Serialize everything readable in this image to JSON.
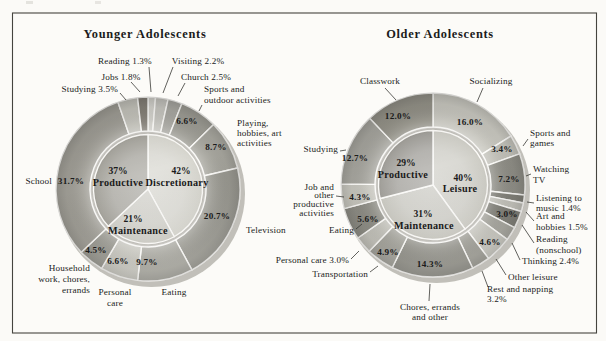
{
  "chart_data": [
    {
      "type": "pie",
      "variant": "nested-donut",
      "title": "Younger Adolescents",
      "inner": [
        {
          "name": "Discretionary",
          "pct_label": "42%",
          "value": 42,
          "shade": "#d4d3cb"
        },
        {
          "name": "Maintenance",
          "pct_label": "21%",
          "value": 21,
          "shade": "#cbcac2"
        },
        {
          "name": "Productive",
          "pct_label": "37%",
          "value": 37,
          "shade": "#9f9d95"
        }
      ],
      "slices": [
        {
          "label": "Reading",
          "value": 1.3,
          "inside_pct": null,
          "outside_lines": [
            "Reading 1.3%"
          ],
          "shade": "#d6d5cf"
        },
        {
          "label": "Visiting",
          "value": 2.2,
          "inside_pct": null,
          "outside_lines": [
            "Visiting 2.2%"
          ],
          "shade": "#c9c8c2"
        },
        {
          "label": "Church",
          "value": 2.5,
          "inside_pct": null,
          "outside_lines": [
            "Church 2.5%"
          ],
          "shade": "#abaaa4"
        },
        {
          "label": "Sports and outdoor activities",
          "value": 6.6,
          "inside_pct": "6.6%",
          "outside_lines": [
            "Sports and",
            "outdoor activities"
          ],
          "shade": "#9e9d95"
        },
        {
          "label": "Playing, hobbies, art activities",
          "value": 8.7,
          "inside_pct": "8.7%",
          "outside_lines": [
            "Playing,",
            "hobbies, art",
            "activities"
          ],
          "shade": "#a7a69e"
        },
        {
          "label": "Television",
          "value": 20.7,
          "inside_pct": "20.7%",
          "outside_lines": [
            "Television"
          ],
          "shade": "#9b9a92"
        },
        {
          "label": "Eating",
          "value": 9.7,
          "inside_pct": "9.7%",
          "outside_lines": [
            "Eating"
          ],
          "shade": "#a7a69e"
        },
        {
          "label": "Personal care",
          "value": 6.6,
          "inside_pct": "6.6%",
          "outside_lines": [
            "Personal",
            "care"
          ],
          "shade": "#c7c6be"
        },
        {
          "label": "Household work, chores, errands",
          "value": 4.5,
          "inside_pct": "4.5%",
          "outside_lines": [
            "Household",
            "work, chores,",
            "errands"
          ],
          "shade": "#9b9a92"
        },
        {
          "label": "School",
          "value": 31.7,
          "inside_pct": "31.7%",
          "outside_lines": [
            "School"
          ],
          "shade": "#a19f97"
        },
        {
          "label": "Studying",
          "value": 3.5,
          "inside_pct": null,
          "outside_lines": [
            "Studying 3.5%"
          ],
          "shade": "#c6c5bd"
        },
        {
          "label": "Jobs",
          "value": 1.8,
          "inside_pct": null,
          "outside_lines": [
            "Jobs 1.8%"
          ],
          "shade": "#868279"
        }
      ]
    },
    {
      "type": "pie",
      "variant": "nested-donut",
      "title": "Older Adolescents",
      "inner": [
        {
          "name": "Leisure",
          "pct_label": "40%",
          "value": 40,
          "shade": "#cac9c1"
        },
        {
          "name": "Maintenance",
          "pct_label": "31%",
          "value": 31,
          "shade": "#c6c5bd"
        },
        {
          "name": "Productive",
          "pct_label": "29%",
          "value": 29,
          "shade": "#999791"
        }
      ],
      "slices": [
        {
          "label": "Socializing",
          "value": 16.0,
          "inside_pct": "16.0%",
          "outside_lines": [
            "Socializing"
          ],
          "shade": "#c9c8c0"
        },
        {
          "label": "Sports and games",
          "value": 3.4,
          "inside_pct": "3.4%",
          "outside_lines": [
            "Sports and",
            "games"
          ],
          "shade": "#c2c1b9"
        },
        {
          "label": "Watching TV",
          "value": 7.2,
          "inside_pct": "7.2%",
          "outside_lines": [
            "Watching",
            "TV"
          ],
          "shade": "#8f8e86"
        },
        {
          "label": "Listening to music",
          "value": 1.4,
          "inside_pct": null,
          "outside_lines": [
            "Listening to",
            "music 1.4%"
          ],
          "shade": "#7e7d75"
        },
        {
          "label": "Art and hobbies",
          "value": 1.5,
          "inside_pct": null,
          "outside_lines": [
            "Art and",
            "hobbies 1.5%"
          ],
          "shade": "#c2c1b9"
        },
        {
          "label": "Reading (nonschool)",
          "value": 3.0,
          "inside_pct": "3.0%",
          "outside_lines": [
            "Reading",
            "(nonschool)"
          ],
          "shade": "#7b7a72"
        },
        {
          "label": "Thinking",
          "value": 2.4,
          "inside_pct": null,
          "outside_lines": [
            "Thinking 2.4%"
          ],
          "shade": "#a3a29a"
        },
        {
          "label": "Other leisure",
          "value": 4.6,
          "inside_pct": "4.6%",
          "outside_lines": [
            "Other leisure"
          ],
          "shade": "#c5c4bc"
        },
        {
          "label": "Rest and napping",
          "value": 3.2,
          "inside_pct": null,
          "outside_lines": [
            "Rest and napping",
            "3.2%"
          ],
          "shade": "#9b9a92"
        },
        {
          "label": "Chores, errands and other",
          "value": 14.3,
          "inside_pct": "14.3%",
          "outside_lines": [
            "Chores, errands",
            "and other"
          ],
          "shade": "#908f87"
        },
        {
          "label": "Transportation",
          "value": 4.9,
          "inside_pct": "4.9%",
          "outside_lines": [
            "Transportation"
          ],
          "shade": "#a3a29a"
        },
        {
          "label": "Personal care",
          "value": 3.0,
          "inside_pct": null,
          "outside_lines": [
            "Personal care 3.0%"
          ],
          "shade": "#c2c1b9"
        },
        {
          "label": "Eating",
          "value": 5.6,
          "inside_pct": "5.6%",
          "outside_lines": [
            "Eating"
          ],
          "shade": "#8d8c84"
        },
        {
          "label": "Job and other productive activities",
          "value": 4.3,
          "inside_pct": "4.3%",
          "outside_lines": [
            "Job and",
            "other",
            "productive",
            "activities"
          ],
          "shade": "#c6c5bd"
        },
        {
          "label": "Studying",
          "value": 12.7,
          "inside_pct": "12.7%",
          "outside_lines": [
            "Studying"
          ],
          "shade": "#a7a69f"
        },
        {
          "label": "Classwork",
          "value": 12.0,
          "inside_pct": "12.0%",
          "outside_lines": [
            "Classwork"
          ],
          "shade": "#959389"
        }
      ]
    }
  ]
}
